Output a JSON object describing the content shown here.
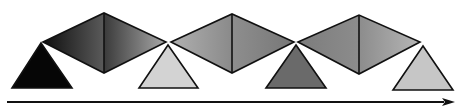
{
  "diagram": {
    "canvas": {
      "width": 467,
      "height": 109,
      "background": "#ffffff"
    },
    "stroke": {
      "color": "#111111",
      "width": 1.6
    },
    "triangles": [
      {
        "name": "triangle-1",
        "points": [
          [
            41,
            43
          ],
          [
            12,
            88
          ],
          [
            72,
            88
          ]
        ],
        "fill": "#060606"
      },
      {
        "name": "triangle-2",
        "points": [
          [
            168,
            45
          ],
          [
            139,
            88
          ],
          [
            198,
            88
          ]
        ],
        "fill": "#d3d3d3"
      },
      {
        "name": "triangle-3",
        "points": [
          [
            296,
            45
          ],
          [
            266,
            88
          ],
          [
            326,
            88
          ]
        ],
        "fill": "#6a6a6a"
      },
      {
        "name": "triangle-4",
        "points": [
          [
            423,
            46
          ],
          [
            393,
            90
          ],
          [
            453,
            90
          ]
        ],
        "fill": "#c6c6c6"
      }
    ],
    "diamonds": [
      {
        "name": "diamond-1",
        "left": [
          43,
          42
        ],
        "top": [
          104,
          13
        ],
        "right": [
          166,
          42
        ],
        "bottom": [
          104,
          73
        ],
        "left_gradient": [
          "#0e0e0e",
          "#5a5a5a"
        ],
        "right_gradient": [
          "#3a3a3a",
          "#a9a9a9"
        ]
      },
      {
        "name": "diamond-2",
        "left": [
          171,
          42
        ],
        "top": [
          232,
          14
        ],
        "right": [
          294,
          42
        ],
        "bottom": [
          232,
          73
        ],
        "left_gradient": [
          "#b0b0b0",
          "#8a8a8a"
        ],
        "right_gradient": [
          "#8e8e8e",
          "#777777"
        ]
      },
      {
        "name": "diamond-3",
        "left": [
          298,
          42
        ],
        "top": [
          359,
          15
        ],
        "right": [
          420,
          42
        ],
        "bottom": [
          359,
          74
        ],
        "left_gradient": [
          "#7c7c7c",
          "#8c8c8c"
        ],
        "right_gradient": [
          "#8c8c8c",
          "#b6b6b6"
        ]
      }
    ],
    "arrow": {
      "start": [
        7,
        102
      ],
      "end": [
        455,
        102
      ],
      "head_length": 13,
      "head_half_width": 4,
      "color": "#111111",
      "line_width": 2
    }
  }
}
